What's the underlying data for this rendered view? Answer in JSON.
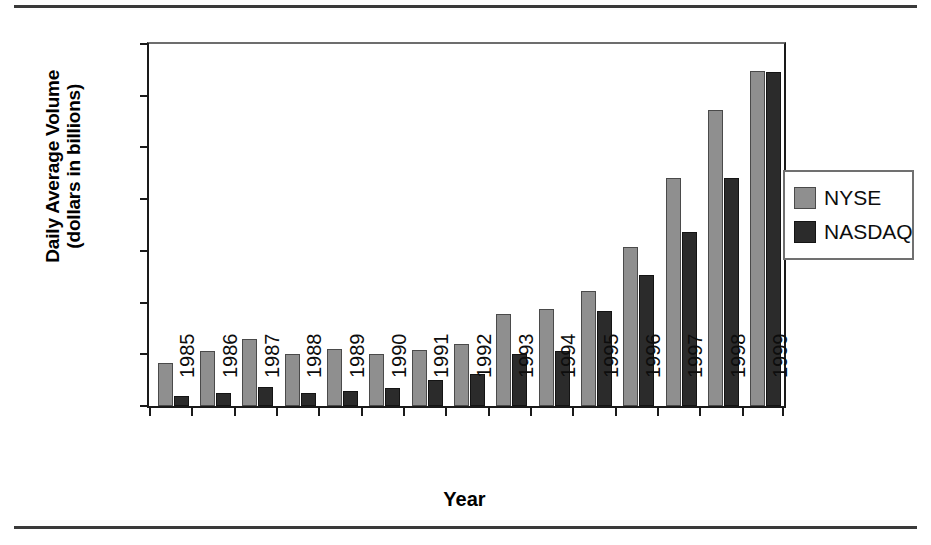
{
  "chart_data": {
    "type": "bar",
    "title": "",
    "xlabel": "Year",
    "ylabel": "Daily Average Volume (dollars in billions)",
    "ylabel_line1": "Daily Average Volume",
    "ylabel_line2": "(dollars in billions)",
    "categories": [
      "1985",
      "1986",
      "1987",
      "1988",
      "1989",
      "1990",
      "1991",
      "1992",
      "1993",
      "1994",
      "1995",
      "1996",
      "1997",
      "1998",
      "1999"
    ],
    "series": [
      {
        "name": "NYSE",
        "color": "#8f8f8f",
        "values": [
          4.2,
          5.3,
          6.5,
          5.0,
          5.5,
          5.0,
          5.4,
          6.0,
          8.9,
          9.4,
          11.1,
          15.4,
          22.0,
          28.6,
          32.4
        ]
      },
      {
        "name": "NASDAQ",
        "color": "#2b2b2b",
        "values": [
          1.0,
          1.3,
          1.8,
          1.3,
          1.5,
          1.7,
          2.5,
          3.1,
          5.0,
          5.3,
          9.2,
          12.7,
          16.8,
          22.0,
          32.3
        ]
      }
    ],
    "ylim": [
      0,
      35
    ],
    "ytick_values": [
      0,
      5,
      10,
      15,
      20,
      25,
      30,
      35
    ],
    "ytick_labels": [
      "$-",
      "$5.0",
      "$10.0",
      "$15.0",
      "$20.0",
      "$25.0",
      "$30.0",
      "$35.0"
    ],
    "grid": false,
    "legend_position": "right"
  },
  "legend": {
    "entries": [
      {
        "label": "NYSE"
      },
      {
        "label": "NASDAQ"
      }
    ]
  }
}
